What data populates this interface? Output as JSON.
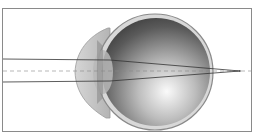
{
  "diagram": {
    "elements": [
      "cornea",
      "lens",
      "eyeball",
      "optical-axis",
      "light-rays",
      "focal-point"
    ],
    "colors": {
      "frame": "#8a8a8a",
      "ray": "#333333",
      "axis": "#888888",
      "eye_dark": "#4a4a4a",
      "eye_light": "#f2f2f2",
      "cornea": "#c8c8c8"
    }
  }
}
